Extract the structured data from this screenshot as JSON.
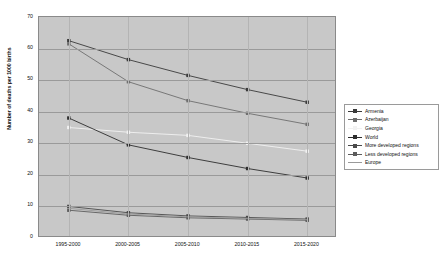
{
  "chart_data": {
    "type": "line",
    "title": "",
    "xlabel": "",
    "ylabel": "Number of deaths per 1000 births",
    "categories": [
      "1995-2000",
      "2000-2005",
      "2005-2010",
      "2010-2015",
      "2015-2020"
    ],
    "ylim": [
      0,
      70
    ],
    "yticks": [
      0,
      10,
      20,
      30,
      40,
      50,
      60,
      70
    ],
    "grid": true,
    "legend_position": "right",
    "plot_background": "#c8c8c8",
    "series": [
      {
        "name": "Armenia",
        "color": "#3a3a3a",
        "marker": "square",
        "values": [
          62.5,
          56.5,
          51.5,
          47.0,
          43.0
        ]
      },
      {
        "name": "Azerbaijan",
        "color": "#6e6e6e",
        "marker": "square",
        "values": [
          61.5,
          49.5,
          43.5,
          39.5,
          36.0
        ]
      },
      {
        "name": "Georgia",
        "color": "#f2f2f2",
        "marker": "square",
        "values": [
          35.0,
          33.5,
          32.5,
          30.0,
          27.5
        ]
      },
      {
        "name": "World",
        "color": "#2e2e2e",
        "marker": "square",
        "values": [
          38.0,
          29.5,
          25.5,
          22.0,
          19.0
        ]
      },
      {
        "name": "More developed regions",
        "color": "#4a4a4a",
        "marker": "square",
        "values": [
          10.0,
          8.0,
          7.0,
          6.5,
          6.0
        ]
      },
      {
        "name": "Less developed regions",
        "color": "#5c5c5c",
        "marker": "square",
        "values": [
          8.8,
          7.2,
          6.4,
          6.0,
          5.6
        ]
      },
      {
        "name": "Europe",
        "color": "#9a9a9a",
        "marker": "none",
        "values": [
          9.4,
          7.6,
          6.7,
          6.2,
          5.8
        ]
      }
    ]
  },
  "legend": {
    "items": [
      {
        "label": "Armenia"
      },
      {
        "label": "Azerbaijan"
      },
      {
        "label": "Georgia"
      },
      {
        "label": "World"
      },
      {
        "label": "More developed regions"
      },
      {
        "label": "Less developed regions"
      },
      {
        "label": "Europe"
      }
    ]
  },
  "axis": {
    "y_title": "Number of deaths per 1000 births",
    "y_labels": [
      "70",
      "60",
      "50",
      "40",
      "30",
      "20",
      "10",
      "0"
    ],
    "x_labels": [
      "1995-2000",
      "2000-2005",
      "2005-2010",
      "2010-2015",
      "2015-2020"
    ]
  }
}
